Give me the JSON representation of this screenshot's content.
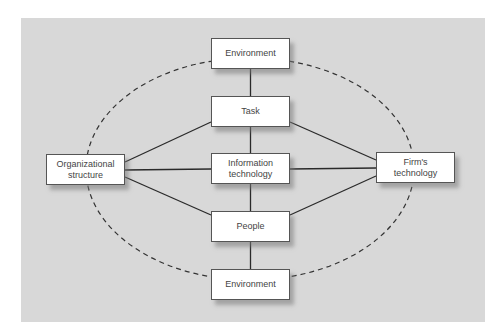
{
  "diagram": {
    "background_color": "#d8d8d8",
    "nodes": {
      "environment_top": {
        "label": "Environment",
        "x": 211,
        "y": 38
      },
      "task": {
        "label": "Task",
        "x": 211,
        "y": 96
      },
      "information_technology": {
        "label_line1": "Information",
        "label_line2": "technology",
        "x": 211,
        "y": 153
      },
      "people": {
        "label": "People",
        "x": 211,
        "y": 211
      },
      "environment_bottom": {
        "label": "Environment",
        "x": 211,
        "y": 269
      },
      "organizational_structure": {
        "label_line1": "Organizational",
        "label_line2": "structure",
        "x": 46,
        "y": 154
      },
      "firms_technology": {
        "label_line1": "Firm's",
        "label_line2": "technology",
        "x": 376,
        "y": 152
      }
    },
    "edges": [
      {
        "from": "environment_top",
        "to": "task",
        "style": "solid"
      },
      {
        "from": "task",
        "to": "information_technology",
        "style": "solid"
      },
      {
        "from": "information_technology",
        "to": "people",
        "style": "solid"
      },
      {
        "from": "people",
        "to": "environment_bottom",
        "style": "solid"
      },
      {
        "from": "organizational_structure",
        "to": "task",
        "style": "solid"
      },
      {
        "from": "organizational_structure",
        "to": "information_technology",
        "style": "solid"
      },
      {
        "from": "organizational_structure",
        "to": "people",
        "style": "solid"
      },
      {
        "from": "firms_technology",
        "to": "task",
        "style": "solid"
      },
      {
        "from": "firms_technology",
        "to": "information_technology",
        "style": "solid"
      },
      {
        "from": "firms_technology",
        "to": "people",
        "style": "solid"
      }
    ],
    "boundary": {
      "shape": "dashed-ellipse",
      "cx": 250,
      "cy": 169,
      "rx": 164,
      "ry": 111
    }
  }
}
